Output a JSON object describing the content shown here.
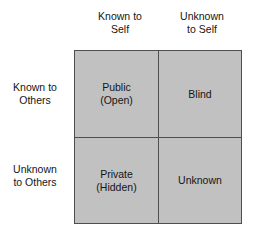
{
  "diagram": {
    "type": "johari-window",
    "colors": {
      "cell_fill": "#c1c1c1",
      "line": "#4f4f4f",
      "text": "#151515",
      "background": "#ffffff"
    },
    "column_headers": [
      {
        "id": "known-self",
        "label": "Known to\nSelf"
      },
      {
        "id": "unknown-self",
        "label": "Unknown\nto Self"
      }
    ],
    "row_headers": [
      {
        "id": "known-others",
        "label": "Known to\nOthers"
      },
      {
        "id": "unknown-others",
        "label": "Unknown\nto Others"
      }
    ],
    "quadrants": [
      {
        "id": "public",
        "label": "Public\n(Open)",
        "row": "known-others",
        "column": "known-self"
      },
      {
        "id": "blind",
        "label": "Blind",
        "row": "known-others",
        "column": "unknown-self"
      },
      {
        "id": "private",
        "label": "Private\n(Hidden)",
        "row": "unknown-others",
        "column": "known-self"
      },
      {
        "id": "unknown",
        "label": "Unknown",
        "row": "unknown-others",
        "column": "unknown-self"
      }
    ]
  }
}
